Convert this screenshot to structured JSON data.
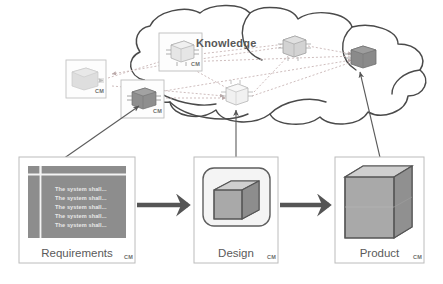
{
  "diagram": {
    "title_label": "Knowledge",
    "cloud": {
      "name": "knowledge-cloud",
      "stroke_color": "#444444"
    },
    "cloud_nodes": [
      {
        "id": "node-left-light",
        "cm_label": "CM",
        "has_box": true,
        "cube_fill": "#d8d8d8",
        "x": 66,
        "y": 60,
        "w": 40,
        "h": 38
      },
      {
        "id": "node-top-light",
        "cm_label": "CM",
        "has_box": true,
        "cube_fill": "#e3e3e3",
        "x": 159,
        "y": 33,
        "w": 43,
        "h": 38
      },
      {
        "id": "node-mid-dark",
        "cm_label": "CM",
        "has_box": true,
        "cube_fill": "#8e8e8e",
        "x": 121,
        "y": 80,
        "w": 43,
        "h": 38
      },
      {
        "id": "node-center-light",
        "cm_label": "",
        "has_box": false,
        "cube_fill": "#ececec",
        "x": 226,
        "y": 86,
        "w": 26,
        "h": 22
      },
      {
        "id": "node-upper-mid",
        "cm_label": "",
        "has_box": false,
        "cube_fill": "#cfcfcf",
        "x": 283,
        "y": 38,
        "w": 26,
        "h": 22
      },
      {
        "id": "node-right-dark",
        "cm_label": "",
        "has_box": false,
        "cube_fill": "#8a8a8a",
        "x": 350,
        "y": 48,
        "w": 26,
        "h": 22
      }
    ],
    "connector_style": {
      "name": "dashed-knowledge-link",
      "color": "#c9b9b9",
      "dash": "2,2"
    },
    "panels": [
      {
        "id": "requirements",
        "label": "Requirements",
        "cm_label": "CM",
        "requirement_rows": [
          "The system shall...",
          "The system shall...",
          "The system shall...",
          "The system shall...",
          "The system shall..."
        ]
      },
      {
        "id": "design",
        "label": "Design",
        "cm_label": "CM"
      },
      {
        "id": "product",
        "label": "Product",
        "cm_label": "CM"
      }
    ],
    "flow_arrows": [
      {
        "id": "req-to-design",
        "from": "requirements",
        "to": "design"
      },
      {
        "id": "design-to-product",
        "from": "design",
        "to": "product"
      }
    ],
    "trace_arrows": [
      {
        "id": "requirements-to-node-mid-dark",
        "double_headed": true
      },
      {
        "id": "design-to-node-center-light",
        "double_headed": true
      },
      {
        "id": "product-to-node-right-dark",
        "double_headed": true
      }
    ],
    "colors": {
      "panel_border": "#b8b8b8",
      "table_fill": "#8d8d8d",
      "table_line": "#f2f2f2",
      "flow_arrow": "#555555",
      "trace_arrow": "#555555",
      "cube_top": "#cfcfcf",
      "cube_front": "#a9a9a9",
      "cube_side": "#8a8a8a",
      "cube_stroke": "#555555"
    }
  }
}
